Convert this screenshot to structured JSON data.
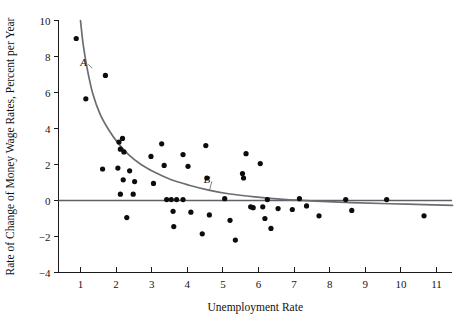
{
  "chart_data": {
    "type": "scatter",
    "title": "",
    "xlabel": "Unemployment Rate",
    "ylabel": "Rate of Change of Money Wage Rates, Percent per Year",
    "xlim": [
      0.0,
      11.6
    ],
    "ylim": [
      -4,
      10
    ],
    "xticks": [
      1,
      2,
      3,
      4,
      5,
      6,
      7,
      8,
      9,
      10,
      11
    ],
    "xtick_labels": [
      "1",
      "2",
      "3",
      "4",
      "5",
      "6",
      "7",
      "8",
      "9",
      "10",
      "11"
    ],
    "yticks": [
      -4,
      -2,
      0,
      2,
      4,
      6,
      8,
      10
    ],
    "ytick_labels": [
      "-4",
      "-2",
      "0",
      "2",
      "4",
      "6",
      "8",
      "10"
    ],
    "grid": false,
    "legend": false,
    "marker_color": "#0c0c0c",
    "curve_color": "#6b6d72",
    "zero_line_color": "#5f6166",
    "points": [
      [
        0.88,
        9.0
      ],
      [
        1.15,
        5.65
      ],
      [
        1.7,
        6.95
      ],
      [
        2.08,
        3.25
      ],
      [
        2.18,
        3.45
      ],
      [
        2.12,
        2.85
      ],
      [
        2.22,
        2.7
      ],
      [
        2.05,
        1.8
      ],
      [
        1.62,
        1.75
      ],
      [
        2.38,
        1.65
      ],
      [
        2.2,
        1.15
      ],
      [
        2.52,
        1.05
      ],
      [
        2.12,
        0.35
      ],
      [
        2.48,
        0.35
      ],
      [
        2.3,
        -0.95
      ],
      [
        2.98,
        2.45
      ],
      [
        3.05,
        0.95
      ],
      [
        3.28,
        3.15
      ],
      [
        3.35,
        1.95
      ],
      [
        3.42,
        0.05
      ],
      [
        3.55,
        0.05
      ],
      [
        3.7,
        0.05
      ],
      [
        3.88,
        0.05
      ],
      [
        3.6,
        -0.6
      ],
      [
        3.62,
        -1.45
      ],
      [
        3.88,
        2.55
      ],
      [
        4.02,
        1.9
      ],
      [
        4.1,
        -0.65
      ],
      [
        4.42,
        -1.85
      ],
      [
        4.52,
        3.05
      ],
      [
        4.55,
        1.25
      ],
      [
        4.62,
        -0.8
      ],
      [
        5.05,
        0.1
      ],
      [
        5.2,
        -1.1
      ],
      [
        5.35,
        -2.2
      ],
      [
        5.55,
        1.5
      ],
      [
        5.58,
        1.25
      ],
      [
        5.65,
        2.6
      ],
      [
        5.78,
        -0.35
      ],
      [
        5.85,
        -0.4
      ],
      [
        6.05,
        2.05
      ],
      [
        6.12,
        -0.35
      ],
      [
        6.18,
        -1.0
      ],
      [
        6.25,
        0.05
      ],
      [
        6.35,
        -1.55
      ],
      [
        6.55,
        -0.45
      ],
      [
        6.95,
        -0.5
      ],
      [
        7.15,
        0.1
      ],
      [
        7.35,
        -0.3
      ],
      [
        7.7,
        -0.85
      ],
      [
        8.45,
        0.05
      ],
      [
        8.62,
        -0.55
      ],
      [
        9.6,
        0.05
      ],
      [
        10.65,
        -0.85
      ]
    ],
    "annotations": [
      {
        "label": "A",
        "x": 1.08,
        "y": 7.45,
        "point_x": 1.33,
        "point_y": 7.35
      },
      {
        "label": "B",
        "x": 4.55,
        "y": 0.95,
        "point_x": 4.62,
        "point_y": 0.55
      }
    ],
    "curve_description": "Downward-sloping convex Phillips curve asymptotic to slightly below zero",
    "curve_points": [
      [
        1.0,
        10.0
      ],
      [
        1.08,
        8.6
      ],
      [
        1.2,
        7.2
      ],
      [
        1.35,
        5.9
      ],
      [
        1.55,
        4.8
      ],
      [
        1.8,
        3.9
      ],
      [
        2.05,
        3.2
      ],
      [
        2.35,
        2.55
      ],
      [
        2.7,
        2.0
      ],
      [
        3.1,
        1.55
      ],
      [
        3.55,
        1.15
      ],
      [
        4.05,
        0.85
      ],
      [
        4.6,
        0.58
      ],
      [
        5.2,
        0.36
      ],
      [
        5.9,
        0.2
      ],
      [
        6.7,
        0.06
      ],
      [
        7.6,
        -0.04
      ],
      [
        8.6,
        -0.12
      ],
      [
        9.7,
        -0.18
      ],
      [
        10.9,
        -0.24
      ],
      [
        11.45,
        -0.27
      ]
    ],
    "zero_line_y": 0
  }
}
